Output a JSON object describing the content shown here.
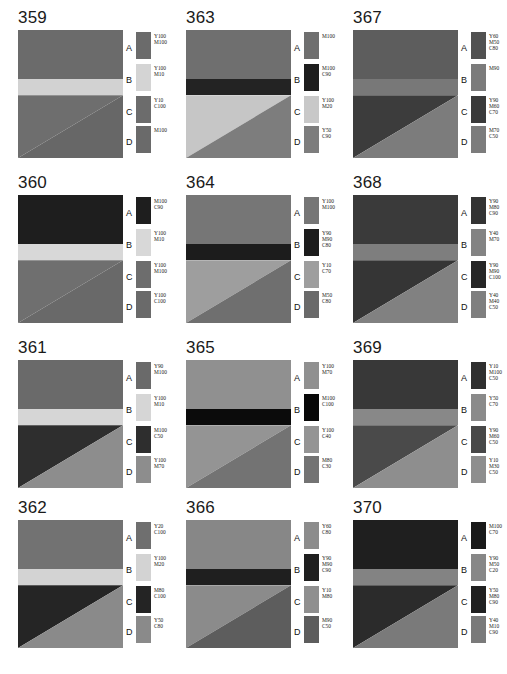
{
  "sheet": {
    "title": "Printing ink reference chart, samples 359-370",
    "zone_letters": [
      "A",
      "B",
      "C",
      "D"
    ],
    "background": "#ffffff"
  },
  "panels": [
    {
      "number": "359",
      "image": {
        "band_a": "#6b6b6b",
        "band_b": "#d2d2d2",
        "tri_c": "#6e6e6e",
        "tri_d": "#676767"
      },
      "zones": [
        {
          "letter": "A",
          "swatch": "#6b6b6b",
          "inks": [
            "Y100",
            "M100"
          ]
        },
        {
          "letter": "B",
          "swatch": "#d4d4d4",
          "inks": [
            "Y100",
            "M10"
          ]
        },
        {
          "letter": "C",
          "swatch": "#6c6c6c",
          "inks": [
            "Y10",
            "C100"
          ]
        },
        {
          "letter": "D",
          "swatch": "#6a6a6a",
          "inks": [
            "M100"
          ]
        }
      ]
    },
    {
      "number": "360",
      "image": {
        "band_a": "#1e1e1e",
        "band_b": "#d8d8d8",
        "tri_c": "#6f6f6f",
        "tri_d": "#696969"
      },
      "zones": [
        {
          "letter": "A",
          "swatch": "#1e1e1e",
          "inks": [
            "M100",
            "C90"
          ]
        },
        {
          "letter": "B",
          "swatch": "#d8d8d8",
          "inks": [
            "Y100",
            "M10"
          ]
        },
        {
          "letter": "C",
          "swatch": "#6d6d6d",
          "inks": [
            "Y100",
            "M100"
          ]
        },
        {
          "letter": "D",
          "swatch": "#6a6a6a",
          "inks": [
            "Y100",
            "C100"
          ]
        }
      ]
    },
    {
      "number": "361",
      "image": {
        "band_a": "#6a6a6a",
        "band_b": "#d6d6d6",
        "tri_c": "#2e2e2e",
        "tri_d": "#8d8d8d"
      },
      "zones": [
        {
          "letter": "A",
          "swatch": "#6a6a6a",
          "inks": [
            "Y90",
            "M100"
          ]
        },
        {
          "letter": "B",
          "swatch": "#d6d6d6",
          "inks": [
            "Y100",
            "M10"
          ]
        },
        {
          "letter": "C",
          "swatch": "#2e2e2e",
          "inks": [
            "M100",
            "C50"
          ]
        },
        {
          "letter": "D",
          "swatch": "#8d8d8d",
          "inks": [
            "Y100",
            "M70"
          ]
        }
      ]
    },
    {
      "number": "362",
      "image": {
        "band_a": "#727272",
        "band_b": "#d3d3d3",
        "tri_c": "#252525",
        "tri_d": "#8a8a8a"
      },
      "zones": [
        {
          "letter": "A",
          "swatch": "#6f6f6f",
          "inks": [
            "Y20",
            "C100"
          ]
        },
        {
          "letter": "B",
          "swatch": "#d3d3d3",
          "inks": [
            "Y100",
            "M20"
          ]
        },
        {
          "letter": "C",
          "swatch": "#242424",
          "inks": [
            "M80",
            "C100"
          ]
        },
        {
          "letter": "D",
          "swatch": "#8a8a8a",
          "inks": [
            "Y50",
            "C80"
          ]
        }
      ]
    },
    {
      "number": "363",
      "image": {
        "band_a": "#6f6f6f",
        "band_b": "#232323",
        "tri_c": "#c6c6c6",
        "tri_d": "#7d7d7d"
      },
      "zones": [
        {
          "letter": "A",
          "swatch": "#6f6f6f",
          "inks": [
            "M100"
          ]
        },
        {
          "letter": "B",
          "swatch": "#1d1d1d",
          "inks": [
            "M100",
            "C90"
          ]
        },
        {
          "letter": "C",
          "swatch": "#c8c8c8",
          "inks": [
            "Y100",
            "M20"
          ]
        },
        {
          "letter": "D",
          "swatch": "#7d7d7d",
          "inks": [
            "Y50",
            "C90"
          ]
        }
      ]
    },
    {
      "number": "364",
      "image": {
        "band_a": "#767676",
        "band_b": "#1c1c1c",
        "tri_c": "#9e9e9e",
        "tri_d": "#6f6f6f"
      },
      "zones": [
        {
          "letter": "A",
          "swatch": "#767676",
          "inks": [
            "Y100",
            "M100"
          ]
        },
        {
          "letter": "B",
          "swatch": "#1c1c1c",
          "inks": [
            "Y90",
            "M90",
            "C80"
          ]
        },
        {
          "letter": "C",
          "swatch": "#9e9e9e",
          "inks": [
            "Y10",
            "C70"
          ]
        },
        {
          "letter": "D",
          "swatch": "#6a6a6a",
          "inks": [
            "M50",
            "C80"
          ]
        }
      ]
    },
    {
      "number": "365",
      "image": {
        "band_a": "#909090",
        "band_b": "#0b0b0b",
        "tri_c": "#949494",
        "tri_d": "#737373"
      },
      "zones": [
        {
          "letter": "A",
          "swatch": "#909090",
          "inks": [
            "Y100",
            "M70"
          ]
        },
        {
          "letter": "B",
          "swatch": "#080808",
          "inks": [
            "M100",
            "C100"
          ]
        },
        {
          "letter": "C",
          "swatch": "#949494",
          "inks": [
            "Y100",
            "C40"
          ]
        },
        {
          "letter": "D",
          "swatch": "#737373",
          "inks": [
            "M80",
            "C30"
          ]
        }
      ]
    },
    {
      "number": "366",
      "image": {
        "band_a": "#878787",
        "band_b": "#1f1f1f",
        "tri_c": "#8b8b8b",
        "tri_d": "#5d5d5d"
      },
      "zones": [
        {
          "letter": "A",
          "swatch": "#8c8c8c",
          "inks": [
            "Y60",
            "C80"
          ]
        },
        {
          "letter": "B",
          "swatch": "#1f1f1f",
          "inks": [
            "Y90",
            "M90",
            "C90"
          ]
        },
        {
          "letter": "C",
          "swatch": "#8f8f8f",
          "inks": [
            "Y10",
            "M80"
          ]
        },
        {
          "letter": "D",
          "swatch": "#5d5d5d",
          "inks": [
            "M90",
            "C50"
          ]
        }
      ]
    },
    {
      "number": "367",
      "image": {
        "band_a": "#5d5d5d",
        "band_b": "#787878",
        "tri_c": "#3c3c3c",
        "tri_d": "#7c7c7c"
      },
      "zones": [
        {
          "letter": "A",
          "swatch": "#515151",
          "inks": [
            "Y60",
            "M50",
            "C80"
          ]
        },
        {
          "letter": "B",
          "swatch": "#7b7b7b",
          "inks": [
            "M90"
          ]
        },
        {
          "letter": "C",
          "swatch": "#3a3a3a",
          "inks": [
            "Y90",
            "M60",
            "C70"
          ]
        },
        {
          "letter": "D",
          "swatch": "#7c7c7c",
          "inks": [
            "M70",
            "C50"
          ]
        }
      ]
    },
    {
      "number": "368",
      "image": {
        "band_a": "#3a3a3a",
        "band_b": "#7e7e7e",
        "tri_c": "#353535",
        "tri_d": "#818181"
      },
      "zones": [
        {
          "letter": "A",
          "swatch": "#333333",
          "inks": [
            "Y90",
            "M80",
            "C90"
          ]
        },
        {
          "letter": "B",
          "swatch": "#838383",
          "inks": [
            "Y40",
            "M70"
          ]
        },
        {
          "letter": "C",
          "swatch": "#262626",
          "inks": [
            "Y90",
            "M90",
            "C100"
          ]
        },
        {
          "letter": "D",
          "swatch": "#7f7f7f",
          "inks": [
            "Y40",
            "M40",
            "C50"
          ]
        }
      ]
    },
    {
      "number": "369",
      "image": {
        "band_a": "#383838",
        "band_b": "#888888",
        "tri_c": "#4a4a4a",
        "tri_d": "#8e8e8e"
      },
      "zones": [
        {
          "letter": "A",
          "swatch": "#2f2f2f",
          "inks": [
            "Y10",
            "M100",
            "C50"
          ]
        },
        {
          "letter": "B",
          "swatch": "#8a8a8a",
          "inks": [
            "Y50",
            "C70"
          ]
        },
        {
          "letter": "C",
          "swatch": "#484848",
          "inks": [
            "Y90",
            "M60",
            "C50"
          ]
        },
        {
          "letter": "D",
          "swatch": "#8e8e8e",
          "inks": [
            "Y10",
            "M30",
            "C50"
          ]
        }
      ]
    },
    {
      "number": "370",
      "image": {
        "band_a": "#1f1f1f",
        "band_b": "#838383",
        "tri_c": "#2b2b2b",
        "tri_d": "#7a7a7a"
      },
      "zones": [
        {
          "letter": "A",
          "swatch": "#191919",
          "inks": [
            "M100",
            "C70"
          ]
        },
        {
          "letter": "B",
          "swatch": "#878787",
          "inks": [
            "Y90",
            "M50",
            "C20"
          ]
        },
        {
          "letter": "C",
          "swatch": "#202020",
          "inks": [
            "Y50",
            "M80",
            "C90"
          ]
        },
        {
          "letter": "D",
          "swatch": "#7a7a7a",
          "inks": [
            "Y40",
            "M10",
            "C90"
          ]
        }
      ]
    }
  ],
  "layout": {
    "column_order": [
      "359",
      "360",
      "361",
      "362",
      "363",
      "364",
      "365",
      "366",
      "367",
      "368",
      "369",
      "370"
    ]
  }
}
